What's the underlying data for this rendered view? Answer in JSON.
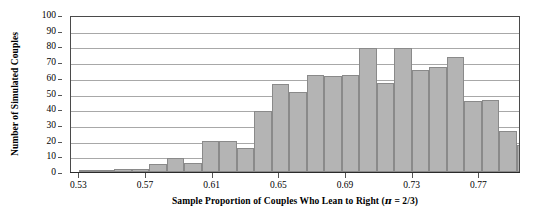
{
  "chart_data": {
    "type": "bar",
    "title": "",
    "xlabel": "Sample Proportion of Couples Who Lean to Right (π = 2/3)",
    "ylabel": "Number of Simulated Couples",
    "ylim": [
      0,
      100
    ],
    "xlim": [
      0.525,
      0.795
    ],
    "bin_width": 0.01,
    "grid": true,
    "legend": null,
    "bar_color": "#b4b4b4",
    "bar_edge_color": "#8a8a8a",
    "y_ticks": [
      0,
      10,
      20,
      30,
      40,
      50,
      60,
      70,
      80,
      90,
      100
    ],
    "y_tick_labels": [
      "0",
      "10",
      "20",
      "30",
      "40",
      "50",
      "60",
      "70",
      "80",
      "90",
      "100"
    ],
    "x_ticks": [
      0.53,
      0.57,
      0.61,
      0.65,
      0.69,
      0.73,
      0.77
    ],
    "x_tick_labels": [
      "0.53",
      "0.57",
      "0.61",
      "0.65",
      "0.69",
      "0.73",
      "0.77"
    ],
    "categories": [
      "0.525",
      "0.535",
      "0.545",
      "0.555",
      "0.565",
      "0.575",
      "0.585",
      "0.595",
      "0.605",
      "0.615",
      "0.625",
      "0.635",
      "0.645",
      "0.655",
      "0.665",
      "0.675",
      "0.685",
      "0.695",
      "0.705",
      "0.715",
      "0.725",
      "0.735",
      "0.745",
      "0.755",
      "0.765",
      "0.775",
      "0.785"
    ],
    "bins": [
      {
        "x0": 0.525,
        "x1": 0.535,
        "value": 0
      },
      {
        "x0": 0.535,
        "x1": 0.545,
        "value": 1
      },
      {
        "x0": 0.545,
        "x1": 0.555,
        "value": 2
      },
      {
        "x0": 0.555,
        "x1": 0.565,
        "value": 2
      },
      {
        "x0": 0.565,
        "x1": 0.575,
        "value": 4
      },
      {
        "x0": 0.575,
        "x1": 0.585,
        "value": 9
      },
      {
        "x0": 0.585,
        "x1": 0.595,
        "value": 6
      },
      {
        "x0": 0.595,
        "x1": 0.605,
        "value": 20
      },
      {
        "x0": 0.605,
        "x1": 0.615,
        "value": 20
      },
      {
        "x0": 0.615,
        "x1": 0.625,
        "value": 15
      },
      {
        "x0": 0.625,
        "x1": 0.635,
        "value": 39
      },
      {
        "x0": 0.635,
        "x1": 0.645,
        "value": 56
      },
      {
        "x0": 0.645,
        "x1": 0.655,
        "value": 51
      },
      {
        "x0": 0.655,
        "x1": 0.665,
        "value": 62
      },
      {
        "x0": 0.665,
        "x1": 0.675,
        "value": 61
      },
      {
        "x0": 0.675,
        "x1": 0.685,
        "value": 62
      },
      {
        "x0": 0.685,
        "x1": 0.695,
        "value": 79
      },
      {
        "x0": 0.695,
        "x1": 0.705,
        "value": 57
      },
      {
        "x0": 0.705,
        "x1": 0.715,
        "value": 79
      },
      {
        "x0": 0.715,
        "x1": 0.725,
        "value": 65
      },
      {
        "x0": 0.725,
        "x1": 0.735,
        "value": 67
      },
      {
        "x0": 0.735,
        "x1": 0.745,
        "value": 73
      },
      {
        "x0": 0.745,
        "x1": 0.755,
        "value": 45
      },
      {
        "x0": 0.755,
        "x1": 0.765,
        "value": 46
      },
      {
        "x0": 0.765,
        "x1": 0.775,
        "value": 26
      },
      {
        "x0": 0.775,
        "x1": 0.785,
        "value": 17
      },
      {
        "x0": 0.785,
        "x1": 0.795,
        "value": 11
      }
    ],
    "values": [
      0,
      1,
      2,
      2,
      4,
      9,
      6,
      20,
      20,
      15,
      39,
      56,
      51,
      62,
      61,
      62,
      79,
      57,
      79,
      65,
      67,
      73,
      45,
      46,
      26,
      17,
      11
    ],
    "bar_sequence": [
      {
        "left": 0.53,
        "width": 0.0105,
        "value": 0.6
      },
      {
        "left": 0.5405,
        "width": 0.0105,
        "value": 1.5
      },
      {
        "left": 0.551,
        "width": 0.0105,
        "value": 2.0
      },
      {
        "left": 0.5615,
        "width": 0.0105,
        "value": 2.0
      },
      {
        "left": 0.572,
        "width": 0.0105,
        "value": 5.0
      },
      {
        "left": 0.5825,
        "width": 0.0105,
        "value": 9.0
      },
      {
        "left": 0.593,
        "width": 0.0105,
        "value": 6.0
      },
      {
        "left": 0.6035,
        "width": 0.0105,
        "value": 20.0
      },
      {
        "left": 0.614,
        "width": 0.0105,
        "value": 20.0
      },
      {
        "left": 0.6245,
        "width": 0.0105,
        "value": 15.0
      },
      {
        "left": 0.635,
        "width": 0.0105,
        "value": 39.0
      },
      {
        "left": 0.6455,
        "width": 0.0105,
        "value": 56.0
      },
      {
        "left": 0.656,
        "width": 0.0105,
        "value": 51.0
      },
      {
        "left": 0.6665,
        "width": 0.0105,
        "value": 62.0
      },
      {
        "left": 0.677,
        "width": 0.0105,
        "value": 61.0
      },
      {
        "left": 0.6875,
        "width": 0.0105,
        "value": 62.0
      },
      {
        "left": 0.698,
        "width": 0.0105,
        "value": 79.0
      },
      {
        "left": 0.7085,
        "width": 0.0105,
        "value": 57.0
      },
      {
        "left": 0.719,
        "width": 0.0105,
        "value": 79.0
      },
      {
        "left": 0.7295,
        "width": 0.0105,
        "value": 65.0
      },
      {
        "left": 0.74,
        "width": 0.0105,
        "value": 67.0
      },
      {
        "left": 0.7505,
        "width": 0.0105,
        "value": 73.0
      },
      {
        "left": 0.761,
        "width": 0.0105,
        "value": 45.0
      },
      {
        "left": 0.7715,
        "width": 0.0105,
        "value": 46.0
      },
      {
        "left": 0.782,
        "width": 0.0105,
        "value": 26.0
      },
      {
        "left": 0.7925,
        "width": 0.0105,
        "value": 17.0
      },
      {
        "left": 0.803,
        "width": 0.0105,
        "value": 11.0
      }
    ]
  },
  "figure": {
    "ylabel": "Number of Simulated Couples",
    "xlabel_prefix": "Sample Proportion of Couples Who Lean to Right (",
    "xlabel_pi": "π",
    "xlabel_suffix": " = 2/3)"
  }
}
